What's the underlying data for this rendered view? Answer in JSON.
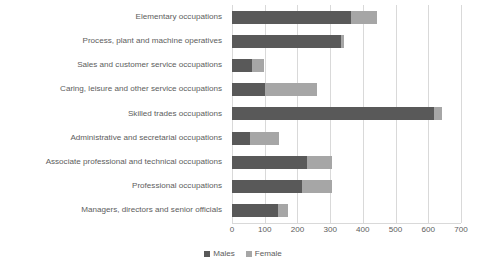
{
  "chart_data": {
    "type": "bar",
    "orientation": "horizontal",
    "stacked": true,
    "title": "",
    "xlabel": "",
    "ylabel": "",
    "xlim": [
      0,
      700
    ],
    "xticks": [
      0,
      100,
      200,
      300,
      400,
      500,
      600,
      700
    ],
    "xtick_labels": [
      "0",
      "100",
      "200",
      "300",
      "400",
      "500",
      "600",
      "700"
    ],
    "grid": "vertical",
    "legend_position": "bottom",
    "categories": [
      "Managers, directors and senior officials",
      "Professional occupations",
      "Associate professional and technical occupations",
      "Administrative and secretarial occupations",
      "Skilled trades occupations",
      "Caring, leisure and other service occupations",
      "Sales and customer service occupations",
      "Process, plant and machine operatives",
      "Elementary occupations"
    ],
    "series": [
      {
        "name": "Males",
        "color": "#595959",
        "values": [
          140,
          214,
          230,
          55,
          618,
          100,
          61,
          333,
          364
        ]
      },
      {
        "name": "Female",
        "color": "#a6a6a6",
        "values": [
          31,
          92,
          76,
          89,
          24,
          160,
          37,
          9,
          79
        ]
      }
    ],
    "totals": [
      171,
      306,
      306,
      144,
      642,
      260,
      98,
      342,
      443
    ]
  },
  "legend": {
    "items": [
      {
        "label": "Males",
        "swatch": "males-swatch"
      },
      {
        "label": "Female",
        "swatch": "female-swatch"
      }
    ]
  },
  "colors": {
    "males": "#595959",
    "female": "#a6a6a6",
    "gridline": "#d9d9d9",
    "text": "#5d5d5d",
    "background": "#ffffff"
  }
}
